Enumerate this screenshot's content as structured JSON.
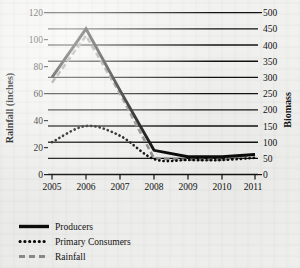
{
  "chart_data": {
    "type": "line",
    "title": "",
    "xlabel": "",
    "ylabel": "Rainfall (inches)",
    "y2label": "Biomass",
    "grid": true,
    "legend_position": "bottom-left",
    "x": [
      "2005",
      "2006",
      "2007",
      "2008",
      "2009",
      "2010",
      "2011"
    ],
    "categories": [
      "2005",
      "2006",
      "2007",
      "2008",
      "2009",
      "2010",
      "2011"
    ],
    "ylim": [
      0,
      120
    ],
    "yticks": [
      "0",
      "20",
      "40",
      "60",
      "80",
      "100",
      "120"
    ],
    "y2lim": [
      0,
      500
    ],
    "y2ticks": [
      "0",
      "50",
      "100",
      "150",
      "200",
      "250",
      "300",
      "350",
      "400",
      "450",
      "500"
    ],
    "series": [
      {
        "name": "Producers",
        "axis": "right",
        "style": "solid",
        "color": "#0b0b0b",
        "values": [
          300,
          450,
          260,
          75,
          55,
          55,
          62
        ],
        "values_left_axis": [
          72,
          108,
          62,
          18,
          13,
          13,
          15
        ]
      },
      {
        "name": "Primary Consumers",
        "axis": "right",
        "style": "dotted",
        "color": "#0b0b0b",
        "values": [
          100,
          150,
          120,
          48,
          45,
          45,
          52
        ],
        "values_left_axis": [
          21,
          35,
          28,
          10,
          9,
          9,
          11
        ]
      },
      {
        "name": "Rainfall",
        "axis": "left",
        "style": "dashed",
        "color": "#8e8e8e",
        "values": [
          68,
          103,
          60,
          12,
          11,
          11,
          15
        ]
      }
    ]
  },
  "axes": {
    "left_title": "Rainfall (inches)",
    "right_title": "Biomass",
    "x_tick_labels": [
      "2005",
      "2006",
      "2007",
      "2008",
      "2009",
      "2010",
      "2011"
    ],
    "left_tick_labels": [
      "120",
      "100",
      "80",
      "60",
      "40",
      "20",
      "0"
    ],
    "right_tick_labels": [
      "500",
      "450",
      "400",
      "350",
      "300",
      "250",
      "200",
      "150",
      "100",
      "50",
      "0"
    ]
  },
  "legend": {
    "entries": [
      {
        "label": "Producers",
        "marker": "solid-line",
        "color": "#0b0b0b"
      },
      {
        "label": "Primary Consumers",
        "marker": "dotted-line",
        "color": "#0b0b0b"
      },
      {
        "label": "Rainfall",
        "marker": "dashed-line",
        "color": "#8e8e8e"
      }
    ]
  },
  "colors": {
    "background": "#f1f1ef",
    "ink": "#111111",
    "gray_series": "#8e8e8e"
  }
}
